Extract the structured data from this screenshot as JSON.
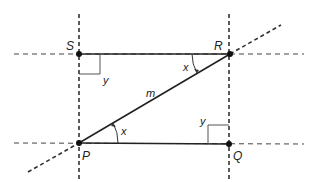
{
  "diagram": {
    "points": {
      "S": {
        "label": "S",
        "x": 79,
        "y": 54
      },
      "R": {
        "label": "R",
        "x": 230,
        "y": 54
      },
      "P": {
        "label": "P",
        "x": 79,
        "y": 143
      },
      "Q": {
        "label": "Q",
        "x": 229,
        "y": 144
      }
    },
    "line_label": "m",
    "angle_labels": {
      "x_at_R": "x",
      "x_at_P": "x",
      "y_at_S": "y",
      "y_at_Q": "y"
    },
    "colors": {
      "stroke": "#222222",
      "dashed": "#333333",
      "right_angle": "#555555"
    }
  }
}
